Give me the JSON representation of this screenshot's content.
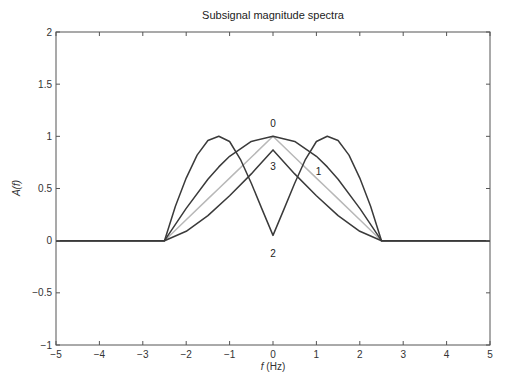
{
  "chart_data": {
    "type": "line",
    "title": "Subsignal magnitude spectra",
    "xlabel": "f (Hz)",
    "xlabel_italic_part": "f",
    "xlabel_rest": " (Hz)",
    "ylabel": "A(f)",
    "xlim": [
      -5,
      5
    ],
    "ylim": [
      -1,
      2
    ],
    "xticks": [
      -5,
      -4,
      -3,
      -2,
      -1,
      0,
      1,
      2,
      3,
      4,
      5
    ],
    "xtick_labels": [
      "−5",
      "−4",
      "−3",
      "−2",
      "−1",
      "0",
      "1",
      "2",
      "3",
      "4",
      "5"
    ],
    "yticks": [
      -1,
      -0.5,
      0,
      0.5,
      1,
      1.5,
      2
    ],
    "ytick_labels": [
      "−1",
      "−0.5",
      "0",
      "0.5",
      "1",
      "1.5",
      "2"
    ],
    "grid": false,
    "legend": "none (curves labeled inline)",
    "series": [
      {
        "name": "0",
        "color": "#3a3a3a",
        "label_pos": [
          0,
          1.12
        ],
        "x": [
          -5,
          -2.5,
          -2,
          -1.5,
          -1.25,
          -1,
          -0.5,
          0,
          0.5,
          1,
          1.25,
          1.5,
          2,
          2.5,
          5
        ],
        "y": [
          0,
          0,
          0.309,
          0.588,
          0.707,
          0.809,
          0.951,
          1.0,
          0.951,
          0.809,
          0.707,
          0.588,
          0.309,
          0,
          0
        ]
      },
      {
        "name": "1",
        "color": "#b8b8b8",
        "label_pos": [
          1.05,
          0.66
        ],
        "x": [
          -5,
          -2.5,
          -2,
          -1.5,
          -1.25,
          -1,
          -0.5,
          0,
          0.5,
          1,
          1.25,
          1.5,
          2,
          2.5,
          5
        ],
        "y": [
          0,
          0,
          0.2,
          0.4,
          0.5,
          0.6,
          0.8,
          1.0,
          0.8,
          0.6,
          0.5,
          0.4,
          0.2,
          0,
          0
        ]
      },
      {
        "name": "2",
        "color": "#3a3a3a",
        "label_pos": [
          0,
          -0.12
        ],
        "x": [
          -5,
          -2.5,
          -2.25,
          -2,
          -1.75,
          -1.5,
          -1.25,
          -1,
          -0.75,
          -0.5,
          -0.25,
          0,
          0.25,
          0.5,
          0.75,
          1,
          1.25,
          1.5,
          1.75,
          2,
          2.25,
          2.5,
          5
        ],
        "y": [
          0,
          0,
          0.33,
          0.6,
          0.82,
          0.96,
          1.0,
          0.95,
          0.78,
          0.55,
          0.3,
          0.05,
          0.3,
          0.55,
          0.78,
          0.95,
          1.0,
          0.96,
          0.82,
          0.6,
          0.33,
          0,
          0
        ]
      },
      {
        "name": "3",
        "color": "#3a3a3a",
        "label_pos": [
          0,
          0.71
        ],
        "x": [
          -5,
          -2.5,
          -2,
          -1.5,
          -1,
          -0.5,
          0,
          0.5,
          1,
          1.5,
          2,
          2.5,
          5
        ],
        "y": [
          0,
          0,
          0.09,
          0.24,
          0.43,
          0.64,
          0.87,
          0.64,
          0.43,
          0.24,
          0.09,
          0,
          0
        ]
      }
    ]
  }
}
